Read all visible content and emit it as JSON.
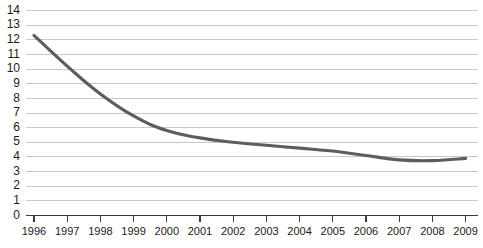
{
  "chart_data": {
    "type": "line",
    "title": "",
    "xlabel": "",
    "ylabel": "",
    "x": [
      1996,
      1997,
      1998,
      1999,
      2000,
      2001,
      2002,
      2003,
      2004,
      2005,
      2006,
      2007,
      2008,
      2009
    ],
    "categories": [
      "1996",
      "1997",
      "1998",
      "1999",
      "2000",
      "2001",
      "2002",
      "2003",
      "2004",
      "2005",
      "2006",
      "2007",
      "2008",
      "2009"
    ],
    "series": [
      {
        "name": "",
        "values": [
          12.3,
          10.2,
          8.3,
          6.8,
          5.8,
          5.3,
          5.0,
          4.8,
          4.6,
          4.4,
          4.1,
          3.8,
          3.75,
          3.9
        ]
      }
    ],
    "values": [
      12.3,
      10.2,
      8.3,
      6.8,
      5.8,
      5.3,
      5.0,
      4.8,
      4.6,
      4.4,
      4.1,
      3.8,
      3.75,
      3.9
    ],
    "ylim": [
      0,
      14
    ],
    "xlim": [
      1996,
      2009
    ],
    "yticks": [
      0,
      1,
      2,
      3,
      4,
      5,
      6,
      7,
      8,
      9,
      10,
      11,
      12,
      13,
      14
    ],
    "ytick_labels": [
      "0",
      "1",
      "2",
      "3",
      "4",
      "5",
      "6",
      "7",
      "8",
      "9",
      "10",
      "11",
      "12",
      "13",
      "14"
    ],
    "xtick_labels": [
      "1996",
      "1997",
      "1998",
      "1999",
      "2000",
      "2001",
      "2002",
      "2003",
      "2004",
      "2005",
      "2006",
      "2007",
      "2008",
      "2009"
    ],
    "grid": "horizontal",
    "legend": "none",
    "line_color": "#5d5d5d",
    "grid_color": "#c9c9c9",
    "axis_color": "#3b3b3b",
    "background_color": "#ffffff"
  }
}
